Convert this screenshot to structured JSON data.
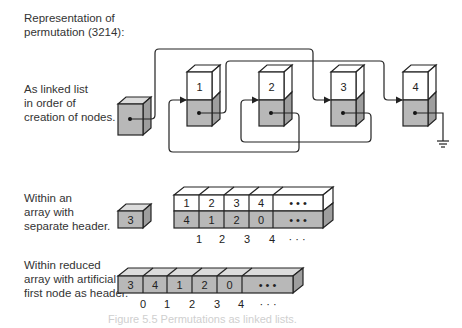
{
  "title": "Representation of\npermutation (3214):",
  "sections": {
    "linked_list": {
      "label": "As linked list\nin order of\ncreation of nodes.",
      "nodes": [
        {
          "id": "header",
          "value": ""
        },
        {
          "id": "n1",
          "value": "1"
        },
        {
          "id": "n2",
          "value": "2"
        },
        {
          "id": "n3",
          "value": "3"
        },
        {
          "id": "n4",
          "value": "4"
        }
      ]
    },
    "separate_header": {
      "label": "Within an\narray with\nseparate header.",
      "header_value": "3",
      "top_row": [
        "1",
        "2",
        "3",
        "4",
        "• • •"
      ],
      "bottom_row": [
        "4",
        "1",
        "2",
        "0",
        "• • •"
      ],
      "indices": [
        "1",
        "2",
        "3",
        "4",
        "· · ·"
      ]
    },
    "reduced_array": {
      "label": "Within reduced\narray with artificial\nfirst node as header.",
      "cells": [
        "3",
        "4",
        "1",
        "2",
        "0",
        "• • •"
      ],
      "indices": [
        "0",
        "1",
        "2",
        "3",
        "4",
        "· · ·"
      ]
    }
  },
  "caption": "Figure 5.5  Permutations as linked lists.",
  "colors": {
    "gray_fill": "#b8b8b8",
    "white_fill": "#ffffff",
    "stroke": "#222222"
  }
}
